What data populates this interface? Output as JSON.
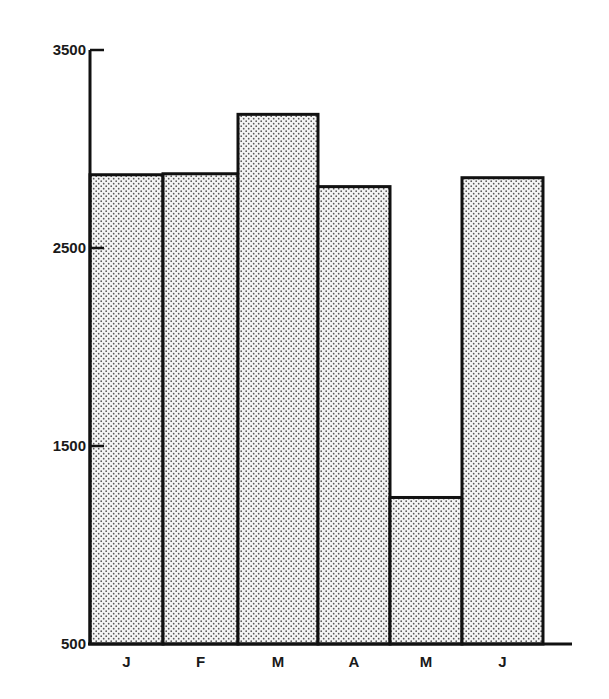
{
  "chart_data": {
    "type": "bar",
    "title": "",
    "xlabel": "",
    "ylabel": "",
    "categories": [
      "J",
      "F",
      "M",
      "A",
      "M",
      "J"
    ],
    "values": [
      2870,
      2875,
      3175,
      2810,
      1240,
      2855
    ],
    "ylim": [
      500,
      3500
    ],
    "yticks": [
      500,
      1500,
      2500,
      3500
    ],
    "ytick_labels": [
      "500",
      "1500",
      "2500",
      "3500"
    ],
    "grid": false,
    "legend": null,
    "bar_style": "stippled dot fill, black outline, adjacent bars touching"
  },
  "colors": {
    "bar_fill_base": "#f2f2f2",
    "bar_dots": "#555555",
    "outline": "#111111"
  }
}
